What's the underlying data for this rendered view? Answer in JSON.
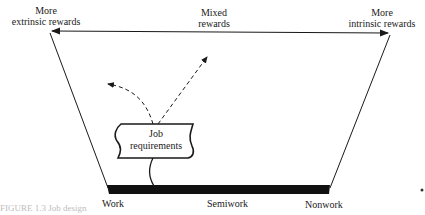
{
  "top_labels": {
    "left": [
      "More",
      "extrinsic rewards"
    ],
    "center": [
      "Mixed",
      "rewards"
    ],
    "right": [
      "More",
      "intrinsic rewards"
    ]
  },
  "box": {
    "line1": "Job",
    "line2": "requirements"
  },
  "bottom_labels": {
    "left": "Work",
    "center": "Semiwork",
    "right": "Nonwork"
  },
  "caption": "FIGURE 1.3  Job design",
  "colors": {
    "ink": "#1a1a1a",
    "background": "#ffffff"
  }
}
